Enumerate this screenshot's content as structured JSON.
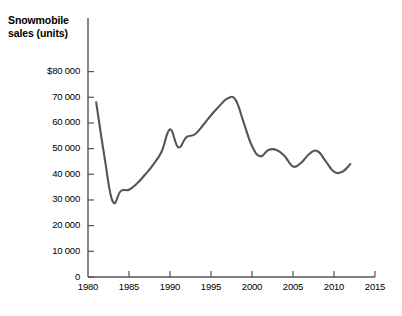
{
  "chart_data": {
    "type": "line",
    "title": "Snowmobile sales (units)",
    "xlabel": "",
    "ylabel": "",
    "xlim": [
      1980,
      2015
    ],
    "ylim": [
      0,
      80000
    ],
    "grid": false,
    "legend": null,
    "line_color": "#555555",
    "axis_color": "#555555",
    "x_ticks": [
      1980,
      1985,
      1990,
      1995,
      2000,
      2005,
      2010,
      2015
    ],
    "x_tick_labels": [
      "1980",
      "1985",
      "1990",
      "1995",
      "2000",
      "2005",
      "2010",
      "2015"
    ],
    "y_ticks": [
      0,
      10000,
      20000,
      30000,
      40000,
      50000,
      60000,
      70000,
      80000
    ],
    "y_tick_labels": [
      "0",
      "10 000",
      "20 000",
      "30 000",
      "40 000",
      "50 000",
      "60 000",
      "70 000",
      "$80 000"
    ],
    "series": [
      {
        "name": "Snowmobile sales",
        "x": [
          1981,
          1982,
          1983,
          1984,
          1985,
          1986,
          1987,
          1988,
          1989,
          1990,
          1991,
          1992,
          1993,
          1994,
          1995,
          1996,
          1997,
          1998,
          1999,
          2000,
          2001,
          2002,
          2003,
          2004,
          2005,
          2006,
          2007,
          2008,
          2009,
          2010,
          2011,
          2012
        ],
        "values": [
          68000,
          47000,
          29500,
          33500,
          34000,
          36500,
          40000,
          44000,
          49000,
          57500,
          50500,
          54500,
          55500,
          59000,
          63000,
          66500,
          69500,
          69000,
          60000,
          51000,
          47000,
          49500,
          49500,
          47000,
          43000,
          44500,
          48000,
          49000,
          45000,
          41000,
          41000,
          44000
        ]
      }
    ]
  }
}
